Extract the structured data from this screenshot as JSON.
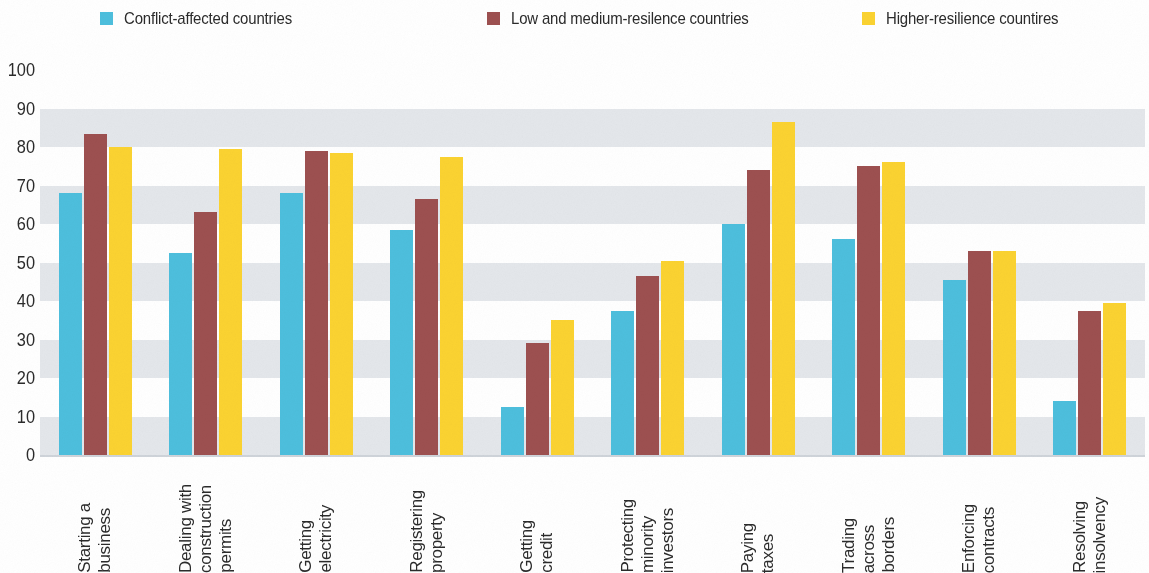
{
  "legend": {
    "items": [
      {
        "label": "Conflict-affected countries",
        "color": "#4dbfdd"
      },
      {
        "label": "Low and medium-resilence countries",
        "color": "#9d5050"
      },
      {
        "label": "Higher-resilience countires",
        "color": "#fbd331"
      }
    ]
  },
  "chart_data": {
    "type": "bar",
    "title": "",
    "xlabel": "",
    "ylabel": "",
    "ylim": [
      0,
      100
    ],
    "yticks": [
      0,
      10,
      20,
      30,
      40,
      50,
      60,
      70,
      80,
      90,
      100
    ],
    "ytick_labels": [
      "0",
      "10",
      "20",
      "30",
      "40",
      "50",
      "60",
      "70",
      "80",
      "90",
      "100"
    ],
    "grid": "horizontal-bands",
    "legend_position": "top",
    "categories": [
      "Starting a business",
      "Dealing with construction permits",
      "Getting electricity",
      "Registering property",
      "Getting credit",
      "Protecting minority investors",
      "Paying taxes",
      "Trading across borders",
      "Enforcing contracts",
      "Resolving insolvency"
    ],
    "category_lines": [
      [
        "Starting a",
        "business"
      ],
      [
        "Dealing with",
        "construction",
        "permits"
      ],
      [
        "Getting",
        "electricity"
      ],
      [
        "Registering",
        "property"
      ],
      [
        "Getting",
        "credit"
      ],
      [
        "Protecting",
        "minority",
        "investors"
      ],
      [
        "Paying",
        "taxes"
      ],
      [
        "Trading",
        "across",
        "borders"
      ],
      [
        "Enforcing",
        "contracts"
      ],
      [
        "Resolving",
        "insolvency"
      ]
    ],
    "series": [
      {
        "name": "Conflict-affected countries",
        "color": "#4dbfdd",
        "values": [
          68,
          52.5,
          68,
          58.5,
          12.5,
          37.5,
          60,
          56,
          45.5,
          14
        ]
      },
      {
        "name": "Low and medium-resilence countries",
        "color": "#9d5050",
        "values": [
          83.5,
          63,
          79,
          66.5,
          29,
          46.5,
          74,
          75,
          53,
          37.5
        ]
      },
      {
        "name": "Higher-resilience countires",
        "color": "#fbd331",
        "values": [
          80,
          79.5,
          78.5,
          77.5,
          35,
          50.5,
          86.5,
          76,
          53,
          39.5
        ]
      }
    ]
  }
}
